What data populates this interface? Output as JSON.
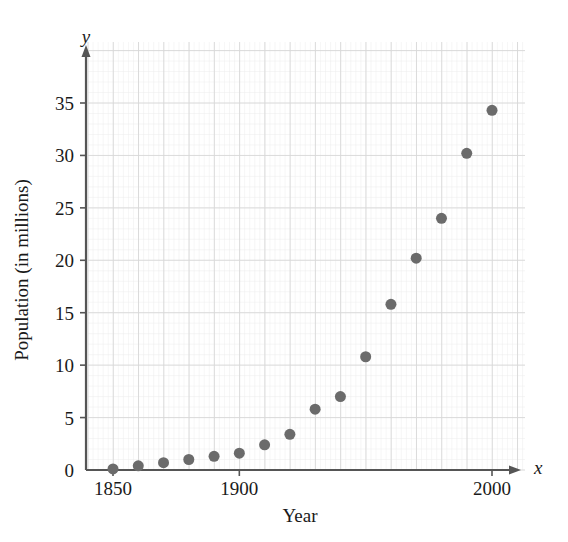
{
  "chart_data": {
    "type": "scatter",
    "title": "",
    "xlabel": "Year",
    "ylabel": "Population (in millions)",
    "x_axis_letter": "x",
    "y_axis_letter": "y",
    "xlim": [
      1845,
      2005
    ],
    "ylim": [
      0,
      38
    ],
    "x_ticks": [
      1850,
      1900,
      2000
    ],
    "x_tick_labels": [
      "1850",
      "1900",
      "2000"
    ],
    "y_ticks": [
      0,
      5,
      10,
      15,
      20,
      25,
      30,
      35
    ],
    "y_tick_labels": [
      "0",
      "5",
      "10",
      "15",
      "20",
      "25",
      "30",
      "35"
    ],
    "grid": true,
    "grid_major_x_step": 10,
    "grid_major_y_step": 5,
    "grid_minor": true,
    "legend": "none",
    "marker_color": "#6b6b6b",
    "marker_size": 11,
    "axis_color": "#555555",
    "grid_color": "#d8d8d8",
    "grid_minor_color": "#ececec",
    "x": [
      1850,
      1860,
      1870,
      1880,
      1890,
      1900,
      1910,
      1920,
      1930,
      1940,
      1950,
      1960,
      1970,
      1980,
      1990,
      2000
    ],
    "values": [
      0.1,
      0.4,
      0.7,
      1.0,
      1.3,
      1.6,
      2.4,
      3.4,
      5.8,
      7.0,
      10.8,
      15.8,
      20.2,
      24.0,
      30.2,
      34.3
    ],
    "points": [
      {
        "year": 1850,
        "population": 0.1
      },
      {
        "year": 1860,
        "population": 0.4
      },
      {
        "year": 1870,
        "population": 0.7
      },
      {
        "year": 1880,
        "population": 1.0
      },
      {
        "year": 1890,
        "population": 1.3
      },
      {
        "year": 1900,
        "population": 1.6
      },
      {
        "year": 1910,
        "population": 2.4
      },
      {
        "year": 1920,
        "population": 3.4
      },
      {
        "year": 1930,
        "population": 5.8
      },
      {
        "year": 1940,
        "population": 7.0
      },
      {
        "year": 1950,
        "population": 10.8
      },
      {
        "year": 1960,
        "population": 15.8
      },
      {
        "year": 1970,
        "population": 20.2
      },
      {
        "year": 1980,
        "population": 24.0
      },
      {
        "year": 1990,
        "population": 30.2
      },
      {
        "year": 2000,
        "population": 34.3
      }
    ]
  }
}
